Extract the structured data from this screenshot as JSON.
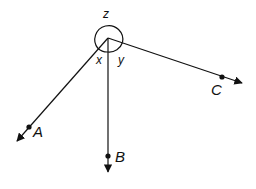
{
  "diagram": {
    "type": "angles-around-a-point",
    "vertex": {
      "x": 108,
      "y": 38
    },
    "rays": [
      {
        "name": "A",
        "label": "A",
        "end": {
          "x": 17,
          "y": 141
        },
        "point": {
          "x": 29,
          "y": 127
        },
        "label_pos": {
          "x": 33,
          "y": 137
        }
      },
      {
        "name": "B",
        "label": "B",
        "end": {
          "x": 108,
          "y": 172
        },
        "point": {
          "x": 108,
          "y": 156
        },
        "label_pos": {
          "x": 115,
          "y": 162
        }
      },
      {
        "name": "C",
        "label": "C",
        "end": {
          "x": 242,
          "y": 83
        },
        "point": {
          "x": 222,
          "y": 77
        },
        "label_pos": {
          "x": 211,
          "y": 95
        }
      }
    ],
    "angles": [
      {
        "name": "x",
        "label": "x",
        "between": [
          "A",
          "B"
        ],
        "label_pos": {
          "x": 96,
          "y": 64
        }
      },
      {
        "name": "y",
        "label": "y",
        "between": [
          "B",
          "C"
        ],
        "label_pos": {
          "x": 118,
          "y": 64
        }
      },
      {
        "name": "z",
        "label": "z",
        "between": [
          "A",
          "C"
        ],
        "reflex": true,
        "label_pos": {
          "x": 103,
          "y": 18
        }
      }
    ],
    "stroke_color": "#111111"
  }
}
